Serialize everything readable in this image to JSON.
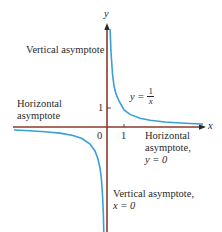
{
  "diagram": {
    "colors": {
      "axes": "#8b3a2e",
      "curve": "#3a9fd8",
      "text": "#2a2a2a"
    },
    "axes": {
      "x_label": "x",
      "y_label": "y",
      "origin_label": "0",
      "x_tick_label": "1",
      "y_tick_label": "1"
    },
    "function_label": {
      "lhs": "y =",
      "numerator": "1",
      "denominator": "x"
    },
    "annotations": {
      "vertical_asymptote_top": "Vertical asymptote",
      "horizontal_asymptote_left_line1": "Horizontal",
      "horizontal_asymptote_left_line2": "asymptote",
      "horizontal_asymptote_right_line1": "Horizontal",
      "horizontal_asymptote_right_line2": "asymptote,",
      "horizontal_asymptote_right_line3": "y = 0",
      "vertical_asymptote_bottom_line1": "Vertical asymptote,",
      "vertical_asymptote_bottom_line2": "x = 0"
    }
  }
}
